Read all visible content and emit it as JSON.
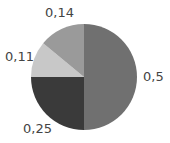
{
  "chart_data": {
    "type": "pie",
    "title": "",
    "start_angle": "12 o'clock",
    "direction": "clockwise",
    "legend": "none",
    "slices": [
      {
        "label": "0,5",
        "value": 0.5,
        "color": "#707070"
      },
      {
        "label": "0,25",
        "value": 0.25,
        "color": "#3a3a3a"
      },
      {
        "label": "0,11",
        "value": 0.11,
        "color": "#c8c8c8"
      },
      {
        "label": "0,14",
        "value": 0.14,
        "color": "#9a9a9a"
      }
    ]
  },
  "labels": {
    "s0": "0,5",
    "s1": "0,25",
    "s2": "0,11",
    "s3": "0,14"
  }
}
